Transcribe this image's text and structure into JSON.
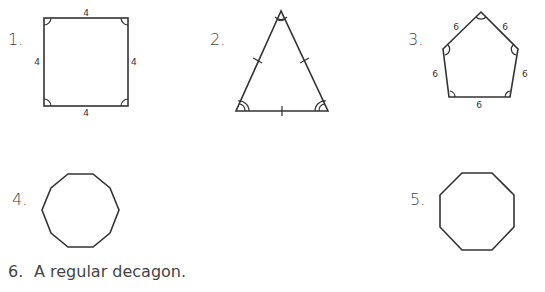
{
  "problems": [
    {
      "number": "1.",
      "shape": "square",
      "side_labels": [
        "4",
        "4",
        "4",
        "4"
      ]
    },
    {
      "number": "2.",
      "shape": "equilateral-triangle",
      "side_labels": []
    },
    {
      "number": "3.",
      "shape": "regular-pentagon",
      "side_labels": [
        "6",
        "6",
        "6",
        "6",
        "6"
      ]
    },
    {
      "number": "4.",
      "shape": "regular-decagon",
      "side_labels": []
    },
    {
      "number": "5.",
      "shape": "regular-octagon",
      "side_labels": []
    },
    {
      "number": "6.",
      "text": "A regular decagon."
    }
  ]
}
